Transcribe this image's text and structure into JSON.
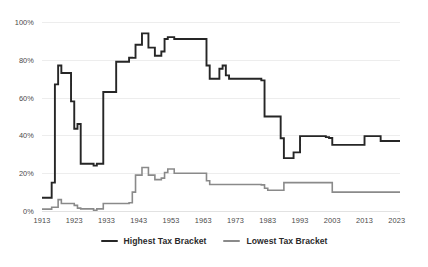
{
  "chart_data": {
    "type": "line",
    "title": "",
    "subtitle": "",
    "xlabel": "",
    "ylabel": "",
    "xlim": [
      1913,
      2024
    ],
    "ylim": [
      0,
      100
    ],
    "grid": true,
    "legend_position": "bottom-center",
    "y_ticks": [
      "0%",
      "20%",
      "40%",
      "60%",
      "80%",
      "100%"
    ],
    "y_tick_values": [
      0,
      20,
      40,
      60,
      80,
      100
    ],
    "x_ticks": [
      "1913",
      "1923",
      "1933",
      "1943",
      "1953",
      "1963",
      "1973",
      "1983",
      "1993",
      "2003",
      "2013",
      "2023"
    ],
    "x_tick_values": [
      1913,
      1923,
      1933,
      1943,
      1953,
      1963,
      1973,
      1983,
      1993,
      2003,
      2013,
      2023
    ],
    "colors": {
      "highest": "#262626",
      "lowest": "#8a8a8a",
      "grid": "#ededed",
      "axis_text": "#4a4a4a",
      "background": "#ffffff"
    },
    "series": [
      {
        "name": "Highest Tax Bracket",
        "color": "#262626",
        "x": [
          1913,
          1914,
          1915,
          1916,
          1917,
          1918,
          1919,
          1920,
          1921,
          1922,
          1923,
          1924,
          1925,
          1926,
          1927,
          1928,
          1929,
          1930,
          1931,
          1932,
          1933,
          1934,
          1935,
          1936,
          1937,
          1938,
          1939,
          1940,
          1941,
          1942,
          1943,
          1944,
          1945,
          1946,
          1947,
          1948,
          1949,
          1950,
          1951,
          1952,
          1953,
          1954,
          1955,
          1956,
          1957,
          1958,
          1959,
          1960,
          1961,
          1962,
          1963,
          1964,
          1965,
          1966,
          1967,
          1968,
          1969,
          1970,
          1971,
          1972,
          1973,
          1974,
          1975,
          1976,
          1977,
          1978,
          1979,
          1980,
          1981,
          1982,
          1983,
          1984,
          1985,
          1986,
          1987,
          1988,
          1989,
          1990,
          1991,
          1992,
          1993,
          1994,
          1995,
          1996,
          1997,
          1998,
          1999,
          2000,
          2001,
          2002,
          2003,
          2004,
          2005,
          2006,
          2007,
          2008,
          2009,
          2010,
          2011,
          2012,
          2013,
          2014,
          2015,
          2016,
          2017,
          2018,
          2019,
          2020,
          2021,
          2022,
          2023,
          2024
        ],
        "values": [
          7,
          7,
          7,
          15,
          67,
          77,
          73,
          73,
          73,
          58,
          43.5,
          46,
          25,
          25,
          25,
          25,
          24,
          25,
          25,
          63,
          63,
          63,
          63,
          79,
          79,
          79,
          79,
          81.1,
          81,
          88,
          88,
          94,
          94,
          86.45,
          86.45,
          82.13,
          82.13,
          84.36,
          91,
          92,
          92,
          91,
          91,
          91,
          91,
          91,
          91,
          91,
          91,
          91,
          91,
          77,
          70,
          70,
          70,
          75.25,
          77,
          71.75,
          70,
          70,
          70,
          70,
          70,
          70,
          70,
          70,
          70,
          70,
          69.125,
          50,
          50,
          50,
          50,
          50,
          38.5,
          28,
          28,
          28,
          31,
          31,
          39.6,
          39.6,
          39.6,
          39.6,
          39.6,
          39.6,
          39.6,
          39.6,
          39.1,
          38.6,
          35,
          35,
          35,
          35,
          35,
          35,
          35,
          35,
          35,
          35,
          39.6,
          39.6,
          39.6,
          39.6,
          39.6,
          37,
          37,
          37,
          37,
          37,
          37,
          37
        ]
      },
      {
        "name": "Lowest Tax Bracket",
        "color": "#8a8a8a",
        "x": [
          1913,
          1914,
          1915,
          1916,
          1917,
          1918,
          1919,
          1920,
          1921,
          1922,
          1923,
          1924,
          1925,
          1926,
          1927,
          1928,
          1929,
          1930,
          1931,
          1932,
          1933,
          1934,
          1935,
          1936,
          1937,
          1938,
          1939,
          1940,
          1941,
          1942,
          1943,
          1944,
          1945,
          1946,
          1947,
          1948,
          1949,
          1950,
          1951,
          1952,
          1953,
          1954,
          1955,
          1956,
          1957,
          1958,
          1959,
          1960,
          1961,
          1962,
          1963,
          1964,
          1965,
          1966,
          1967,
          1968,
          1969,
          1970,
          1971,
          1972,
          1973,
          1974,
          1975,
          1976,
          1977,
          1978,
          1979,
          1980,
          1981,
          1982,
          1983,
          1984,
          1985,
          1986,
          1987,
          1988,
          1989,
          1990,
          1991,
          1992,
          1993,
          1994,
          1995,
          1996,
          1997,
          1998,
          1999,
          2000,
          2001,
          2002,
          2003,
          2004,
          2005,
          2006,
          2007,
          2008,
          2009,
          2010,
          2011,
          2012,
          2013,
          2014,
          2015,
          2016,
          2017,
          2018,
          2019,
          2020,
          2021,
          2022,
          2023,
          2024
        ],
        "values": [
          1,
          1,
          1,
          2,
          2,
          6,
          4,
          4,
          4,
          4,
          3,
          1.5,
          1.125,
          1.125,
          1.125,
          1.125,
          0.375,
          1.125,
          1.125,
          4,
          4,
          4,
          4,
          4,
          4,
          4,
          4,
          4.4,
          10,
          19,
          19,
          23,
          23,
          19,
          19,
          16.6,
          16.6,
          17.4,
          20.4,
          22.2,
          22.2,
          20,
          20,
          20,
          20,
          20,
          20,
          20,
          20,
          20,
          20,
          16,
          14,
          14,
          14,
          14,
          14,
          14,
          14,
          14,
          14,
          14,
          14,
          14,
          14,
          14,
          14,
          14,
          13.825,
          12,
          11,
          11,
          11,
          11,
          11,
          15,
          15,
          15,
          15,
          15,
          15,
          15,
          15,
          15,
          15,
          15,
          15,
          15,
          15,
          15,
          10,
          10,
          10,
          10,
          10,
          10,
          10,
          10,
          10,
          10,
          10,
          10,
          10,
          10,
          10,
          10,
          10,
          10,
          10,
          10,
          10,
          10
        ]
      }
    ]
  },
  "legend": {
    "items": [
      {
        "label": "Highest Tax Bracket",
        "color": "#262626"
      },
      {
        "label": "Lowest Tax Bracket",
        "color": "#8a8a8a"
      }
    ]
  }
}
